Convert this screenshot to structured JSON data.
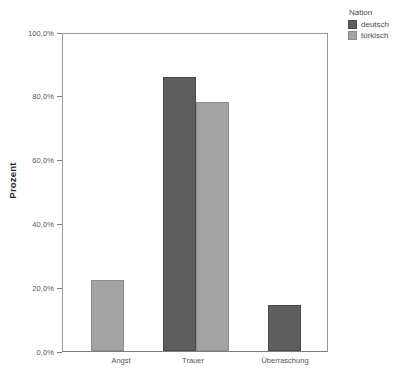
{
  "chart_data": {
    "type": "bar",
    "title": "",
    "caption": "",
    "xlabel": "",
    "ylabel": "Prozent",
    "categories": [
      "Angst",
      "Trauer",
      "Überraschung"
    ],
    "series": [
      {
        "name": "deutsch",
        "color": "#5e5e5e",
        "values": [
          null,
          86.0,
          14.5
        ]
      },
      {
        "name": "türkisch",
        "color": "#a3a3a3",
        "values": [
          22.3,
          78.0,
          null
        ]
      }
    ],
    "ylim": [
      0,
      100
    ],
    "y_ticks": [
      0,
      20,
      40,
      60,
      80,
      100
    ],
    "y_tick_labels": [
      "0,0%",
      "20,0%",
      "40,0%",
      "60,0%",
      "80,0%",
      "100,0%"
    ],
    "grid": false,
    "legend_position": "top-right",
    "legend_title": "Nation"
  },
  "legend": {
    "title": "Nation",
    "items": [
      {
        "label": "deutsch",
        "color": "#5e5e5e"
      },
      {
        "label": "türkisch",
        "color": "#a3a3a3"
      }
    ]
  },
  "axes": {
    "y_title": "Prozent",
    "y_labels": [
      "100,0%",
      "80,0%",
      "60,0%",
      "40,0%",
      "20,0%",
      "0,0%"
    ],
    "x_labels": [
      "Angst",
      "Trauer",
      "Überraschung"
    ]
  }
}
